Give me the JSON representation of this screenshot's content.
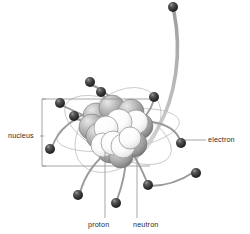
{
  "figure": {
    "background_color": "#ffffff",
    "width": 250,
    "height": 234
  },
  "labels": {
    "nucleus": "nucleus",
    "electron": "electron",
    "proton": "proton",
    "neutron": "neutron"
  },
  "colors": {
    "electron": "#2e2e2e",
    "electron_highlight": "#8a8a8a",
    "proton": "#9b9b9b",
    "neutron": "#fbfbfb",
    "outline": "#7a7a7a",
    "leader_line": "#8f8f8f",
    "bracket": "#8f8f8f",
    "trail": "#9a9a9a",
    "text": "#2b2b2b"
  },
  "nucleus": {
    "center": [
      118,
      130
    ],
    "protons": [
      [
        96,
        116
      ],
      [
        112,
        108
      ],
      [
        131,
        112
      ],
      [
        140,
        126
      ],
      [
        99,
        136
      ],
      [
        134,
        144
      ],
      [
        110,
        150
      ],
      [
        121,
        156
      ],
      [
        92,
        127
      ],
      [
        126,
        128
      ]
    ],
    "neutrons": [
      [
        119,
        122
      ],
      [
        106,
        128
      ],
      [
        130,
        138
      ],
      [
        113,
        143
      ],
      [
        123,
        146
      ],
      [
        103,
        145
      ],
      [
        136,
        122
      ]
    ]
  },
  "electrons": [
    {
      "id": "e-top-right",
      "position": [
        173,
        7
      ]
    },
    {
      "id": "e-upper-mid",
      "position": [
        90,
        82
      ]
    },
    {
      "id": "e-upper-left",
      "position": [
        101,
        92
      ]
    },
    {
      "id": "e-left-upper",
      "position": [
        60,
        103
      ]
    },
    {
      "id": "e-left-inner",
      "position": [
        74,
        116
      ]
    },
    {
      "id": "e-left-lower",
      "position": [
        50,
        149
      ]
    },
    {
      "id": "e-right-upper",
      "position": [
        154,
        97
      ]
    },
    {
      "id": "e-right-mid",
      "position": [
        181,
        143
      ]
    },
    {
      "id": "e-bottom-left",
      "position": [
        78,
        195
      ]
    },
    {
      "id": "e-bottom-mid",
      "position": [
        116,
        203
      ]
    },
    {
      "id": "e-bottom-right",
      "position": [
        148,
        185
      ]
    },
    {
      "id": "e-far-right",
      "position": [
        196,
        173
      ]
    }
  ],
  "bracket": {
    "left": 42,
    "top": 99,
    "right": 150,
    "bottom": 166
  },
  "leaders": {
    "nucleus_to_bracket": "horizontal tick from label to bracket at y=136",
    "electron_from_sphere": "horizontal line x=184 to x=206 at y=140",
    "proton_vertical": "x=105 from y=150 to y=218",
    "neutron_vertical": "x=137 from y=150 to y=218"
  }
}
